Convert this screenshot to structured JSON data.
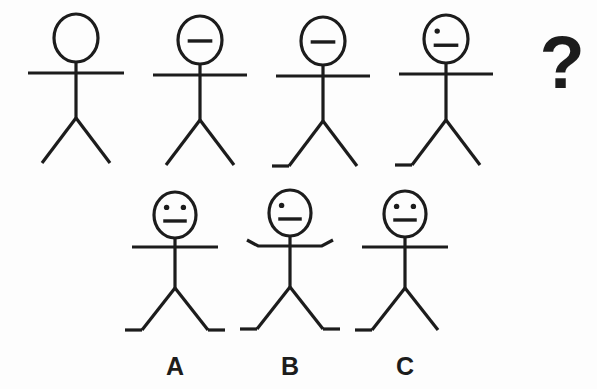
{
  "puzzle": {
    "type": "visual-analogy-sequence",
    "background_color": "#fdfdfd",
    "ink_color": "#1c1c1c",
    "question_mark": "?",
    "sequence_row": {
      "name": "sequence",
      "figures": [
        {
          "id": "sequence-figure-1",
          "position": 1,
          "cx": 76,
          "head_cy": 38,
          "head_rx": 22,
          "head_ry": 24,
          "eyes": 0,
          "mouth": false,
          "arms": "straight",
          "arm_half_width": 48,
          "arm_y": 73,
          "body_bottom": 118,
          "leg_spread": 34,
          "leg_bottom": 163,
          "left_foot": false,
          "right_foot": false
        },
        {
          "id": "sequence-figure-2",
          "position": 2,
          "cx": 200,
          "head_cy": 40,
          "head_rx": 22,
          "head_ry": 24,
          "eyes": 0,
          "mouth": true,
          "arms": "straight",
          "arm_half_width": 47,
          "arm_y": 75,
          "body_bottom": 120,
          "leg_spread": 34,
          "leg_bottom": 165,
          "left_foot": false,
          "right_foot": false
        },
        {
          "id": "sequence-figure-3",
          "position": 3,
          "cx": 323,
          "head_cy": 41,
          "head_rx": 22,
          "head_ry": 24,
          "eyes": 0,
          "mouth": true,
          "arms": "straight",
          "arm_half_width": 47,
          "arm_y": 76,
          "body_bottom": 121,
          "leg_spread": 34,
          "leg_bottom": 166,
          "left_foot": true,
          "right_foot": false
        },
        {
          "id": "sequence-figure-4",
          "position": 4,
          "cx": 446,
          "head_cy": 39,
          "head_rx": 22,
          "head_ry": 24,
          "eyes": 1,
          "mouth": true,
          "arms": "straight",
          "arm_half_width": 47,
          "arm_y": 74,
          "body_bottom": 120,
          "leg_spread": 34,
          "leg_bottom": 165,
          "left_foot": true,
          "right_foot": false
        }
      ],
      "missing_slot": {
        "id": "missing-slot",
        "cx": 562,
        "cy": 88,
        "symbol": "?"
      }
    },
    "options_row": {
      "name": "answer-options",
      "options": [
        {
          "id": "option-a",
          "label": "A",
          "cx": 175,
          "head_cy": 215,
          "head_rx": 21,
          "head_ry": 23,
          "eyes": 2,
          "mouth": true,
          "arms": "straight",
          "arm_half_width": 43,
          "arm_y": 247,
          "body_bottom": 288,
          "leg_spread": 33,
          "leg_bottom": 330,
          "left_foot": true,
          "right_foot": true,
          "label_x": 175,
          "label_y": 375
        },
        {
          "id": "option-b",
          "label": "B",
          "cx": 290,
          "head_cy": 213,
          "head_rx": 21,
          "head_ry": 23,
          "eyes": 1,
          "mouth": true,
          "arms": "hands-up",
          "arm_half_width": 43,
          "arm_y": 246,
          "body_bottom": 287,
          "leg_spread": 33,
          "leg_bottom": 329,
          "left_foot": true,
          "right_foot": true,
          "label_x": 290,
          "label_y": 375
        },
        {
          "id": "option-c",
          "label": "C",
          "cx": 405,
          "head_cy": 214,
          "head_rx": 21,
          "head_ry": 23,
          "eyes": 2,
          "mouth": true,
          "arms": "straight",
          "arm_half_width": 43,
          "arm_y": 247,
          "body_bottom": 288,
          "leg_spread": 33,
          "leg_bottom": 330,
          "left_foot": true,
          "right_foot": false,
          "label_x": 405,
          "label_y": 375
        }
      ]
    }
  }
}
